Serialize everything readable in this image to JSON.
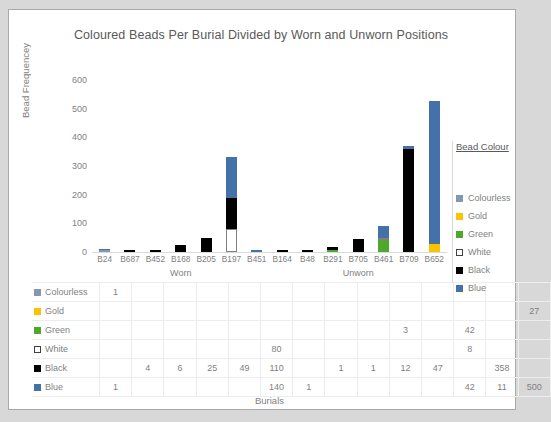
{
  "chart_data": {
    "type": "bar",
    "stacked": true,
    "title": "Coloured Beads Per Burial Divided by Worn and Unworn Positions",
    "xlabel": "Burials",
    "ylabel": "Bead Frequencey",
    "ylim": [
      0,
      600
    ],
    "yticks": [
      "0",
      "100",
      "200",
      "300",
      "400",
      "500",
      "600"
    ],
    "grid": false,
    "legend_title": "Bead Colour",
    "legend_position": "right",
    "categories": [
      "B24",
      "B687",
      "B452",
      "B168",
      "B205",
      "B197",
      "B451",
      "B164",
      "B48",
      "B291",
      "B705",
      "B461",
      "B709",
      "B652"
    ],
    "groups": [
      {
        "label": "Worn",
        "start": 0,
        "end": 7
      },
      {
        "label": "Unworn",
        "start": 7,
        "end": 14
      }
    ],
    "series": [
      {
        "name": "Colourless",
        "color": "#8497B0",
        "values": [
          1,
          null,
          null,
          null,
          null,
          null,
          null,
          null,
          null,
          null,
          null,
          null,
          null,
          null
        ]
      },
      {
        "name": "Gold",
        "color": "#FFC000",
        "values": [
          null,
          null,
          null,
          null,
          null,
          null,
          null,
          null,
          null,
          null,
          null,
          null,
          null,
          27
        ]
      },
      {
        "name": "Green",
        "color": "#4EA72E",
        "values": [
          null,
          null,
          null,
          null,
          null,
          null,
          null,
          null,
          null,
          3,
          null,
          42,
          null,
          null
        ]
      },
      {
        "name": "White",
        "color": "#FFFFFF",
        "values": [
          null,
          null,
          null,
          null,
          null,
          80,
          null,
          null,
          null,
          null,
          null,
          8,
          null,
          null
        ]
      },
      {
        "name": "Black",
        "color": "#000000",
        "values": [
          null,
          4,
          6,
          25,
          49,
          110,
          null,
          1,
          1,
          12,
          47,
          null,
          358,
          null
        ]
      },
      {
        "name": "Blue",
        "color": "#4472A8",
        "values": [
          1,
          null,
          null,
          null,
          null,
          140,
          1,
          null,
          null,
          null,
          null,
          42,
          11,
          500
        ]
      }
    ]
  },
  "table": {
    "row_labels": [
      "Colourless",
      "Gold",
      "Green",
      "White",
      "Black",
      "Blue"
    ],
    "rows": [
      [
        "1",
        "",
        "",
        "",
        "",
        "",
        "",
        "",
        "",
        "",
        "",
        "",
        "",
        ""
      ],
      [
        "",
        "",
        "",
        "",
        "",
        "",
        "",
        "",
        "",
        "",
        "",
        "",
        "",
        "27"
      ],
      [
        "",
        "",
        "",
        "",
        "",
        "",
        "",
        "",
        "",
        "3",
        "",
        "42",
        "",
        ""
      ],
      [
        "",
        "",
        "",
        "",
        "",
        "80",
        "",
        "",
        "",
        "",
        "",
        "8",
        "",
        ""
      ],
      [
        "",
        "4",
        "6",
        "25",
        "49",
        "110",
        "",
        "1",
        "1",
        "12",
        "47",
        "",
        "358",
        ""
      ],
      [
        "1",
        "",
        "",
        "",
        "",
        "140",
        "1",
        "",
        "",
        "",
        "",
        "42",
        "11",
        "500"
      ]
    ]
  }
}
